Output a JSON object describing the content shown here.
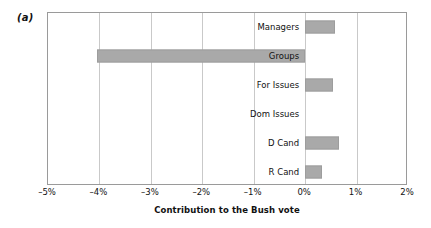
{
  "figure": {
    "panel_label": "(a)",
    "background_color": "#ffffff",
    "bar_color": "#a9a9a9",
    "grid_color": "#c9c9c9",
    "frame_color": "#9a9a9a"
  },
  "chart_data": {
    "type": "bar",
    "orientation": "horizontal",
    "title": "",
    "subtitle": "",
    "xlabel": "Contribution to the Bush vote",
    "ylabel": "",
    "categories": [
      "Managers",
      "Groups",
      "For Issues",
      "Dom Issues",
      "D Cand",
      "R Cand"
    ],
    "values": [
      0.58,
      -4.05,
      0.55,
      0.0,
      0.66,
      0.33
    ],
    "value_unit": "%",
    "xlim": [
      -5,
      2
    ],
    "xticks": [
      -5,
      -4,
      -3,
      -2,
      -1,
      0,
      1,
      2
    ],
    "xtick_labels": [
      "–5%",
      "–4%",
      "–3%",
      "–2%",
      "–1%",
      "0%",
      "1%",
      "2%"
    ],
    "grid": "vertical",
    "legend": "none",
    "category_label_position": "right-aligned at zero line",
    "series": [
      {
        "name": "Contribution to the Bush vote",
        "values": [
          0.58,
          -4.05,
          0.55,
          0.0,
          0.66,
          0.33
        ]
      }
    ]
  }
}
